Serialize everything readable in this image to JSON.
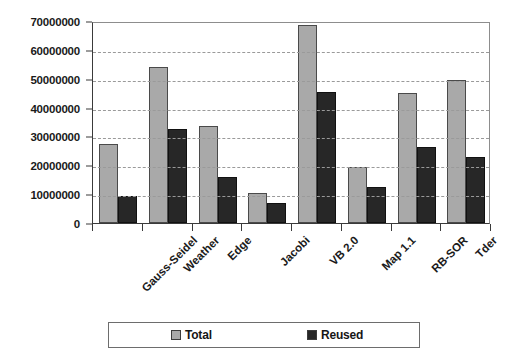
{
  "chart_data": {
    "type": "bar",
    "title": "",
    "xlabel": "",
    "ylabel": "",
    "grid": true,
    "legend_position": "bottom",
    "ylim": [
      0,
      70000000
    ],
    "ytick_step": 10000000,
    "ytick_labels": [
      "0",
      "10000000",
      "20000000",
      "30000000",
      "40000000",
      "50000000",
      "60000000",
      "70000000"
    ],
    "ytick_values": [
      0,
      10000000,
      20000000,
      30000000,
      40000000,
      50000000,
      60000000,
      70000000
    ],
    "categories": [
      "Gauss-Seidel",
      "Weather",
      "Edge",
      "Jacobi",
      "VB 2.0",
      "Map 1.1",
      "RB-SOR",
      "Tder"
    ],
    "series": [
      {
        "name": "Total",
        "color": "#a9a9a9",
        "values": [
          27500000,
          54000000,
          33500000,
          10300000,
          68500000,
          19300000,
          45000000,
          49500000
        ]
      },
      {
        "name": "Reused",
        "color": "#272727",
        "values": [
          9300000,
          32500000,
          16000000,
          7000000,
          45500000,
          12500000,
          26500000,
          23000000
        ]
      }
    ]
  },
  "legend": {
    "entries": [
      {
        "label": "Total"
      },
      {
        "label": "Reused"
      }
    ]
  },
  "colors": {
    "total": "#a9a9a9",
    "reused": "#272727",
    "axis": "#3a3a3a",
    "grid": "#9a9a9a",
    "background": "#ffffff"
  }
}
